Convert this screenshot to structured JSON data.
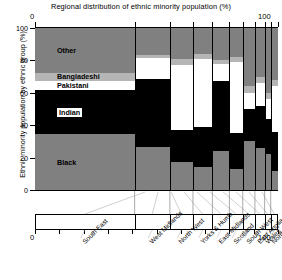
{
  "chart_data": {
    "type": "bar",
    "variant": "mosaic-stacked-100-percent",
    "title": "Regional distribution of ethnic minority population (%)",
    "xlabel": "",
    "ylabel": "Ethnic minority population by ethnic group (%)",
    "xlim": [
      0,
      100
    ],
    "ylim": [
      0,
      100
    ],
    "x_ticklabels": [
      "0",
      "100"
    ],
    "y_ticklabels": [
      "0",
      "20",
      "40",
      "60",
      "80",
      "100"
    ],
    "y_tickvalues": [
      0,
      20,
      40,
      60,
      80,
      100
    ],
    "grid": false,
    "legend": "inline-segment-labels",
    "categories": [
      "South East",
      "West Midlands",
      "North West",
      "Yorks & Humb",
      "East Midlands",
      "Scotland",
      "South West",
      "East Anglia",
      "Wales",
      "North"
    ],
    "category_widths": [
      41.0,
      14.5,
      9.5,
      8.0,
      7.0,
      5.5,
      5.0,
      4.0,
      2.5,
      3.0
    ],
    "series": [
      {
        "name": "Black",
        "color": "#808080",
        "values": [
          34.5,
          26.5,
          17.0,
          14.0,
          24.0,
          13.0,
          30.0,
          26.0,
          22.0,
          12.0
        ]
      },
      {
        "name": "Indian",
        "color": "#000000",
        "values": [
          27.0,
          42.0,
          20.0,
          25.0,
          43.0,
          22.0,
          20.0,
          26.0,
          22.0,
          24.0
        ]
      },
      {
        "name": "Pakistani",
        "color": "#ffffff",
        "values": [
          6.0,
          13.0,
          40.0,
          42.0,
          11.0,
          44.0,
          10.0,
          14.0,
          12.0,
          28.0
        ]
      },
      {
        "name": "Bangladeshi",
        "color": "#b5b5b5",
        "values": [
          5.0,
          2.0,
          4.0,
          3.0,
          2.0,
          3.0,
          4.0,
          4.0,
          4.0,
          4.0
        ]
      },
      {
        "name": "Other",
        "color": "#808080",
        "values": [
          27.5,
          16.5,
          19.0,
          16.0,
          20.0,
          18.0,
          36.0,
          30.0,
          40.0,
          32.0
        ]
      }
    ],
    "segment_labels": [
      {
        "text": "Other",
        "boxed": false
      },
      {
        "text": "Bangladeshi",
        "boxed": false
      },
      {
        "text": "Pakistani",
        "boxed": false
      },
      {
        "text": "Indian",
        "boxed": true
      },
      {
        "text": "Black",
        "boxed": false
      }
    ]
  },
  "axes": {
    "top_left_value": "0",
    "top_right_value": "100",
    "bottom_left_value": "0",
    "bottom_right_value": "100"
  },
  "colors": {
    "black": "#000000",
    "grey": "#808080",
    "light_grey": "#b5b5b5",
    "white": "#ffffff",
    "axis": "#000000",
    "background": "#ffffff"
  }
}
